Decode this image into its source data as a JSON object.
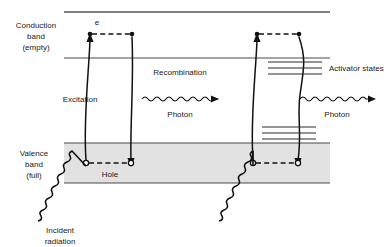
{
  "figure": {
    "background_color": "#ffffff",
    "line_color": "#111111",
    "band_fill_color": "#e2e2e2",
    "band_edge_color": "#4a4a4a"
  },
  "labels": {
    "conduction_band": "Conduction\nband\n(empty)",
    "conduction_band_line1": "Conduction",
    "conduction_band_line2": "band",
    "conduction_band_line3": "(empty)",
    "valence_band_line1": "Valence",
    "valence_band_line2": "band",
    "valence_band_line3": "(full)",
    "electron": "e",
    "hole": "Hole",
    "excitation": "Excitation",
    "recombination": "Recombination",
    "photon_left": "Photon",
    "photon_right": "Photon",
    "activator_states": "Activator states",
    "incident_radiation_line1": "Incident",
    "incident_radiation_line2": "radiation"
  },
  "bands": {
    "conduction": {
      "top_y": 12,
      "bottom_y": 58,
      "x_start": 64,
      "x_end": 330,
      "state": "empty"
    },
    "valence": {
      "top_y": 143,
      "bottom_y": 183,
      "x_start": 64,
      "x_end": 330,
      "state": "full",
      "filled": true
    }
  },
  "activator_states": {
    "upper_set": {
      "count": 3,
      "y_values": [
        62,
        68,
        74
      ],
      "x_start": 268,
      "x_end": 322
    },
    "lower_set": {
      "count": 3,
      "y_values": [
        127,
        133,
        139
      ],
      "x_start": 262,
      "x_end": 316
    }
  },
  "processes": [
    {
      "name": "excitation-left",
      "type": "electron-excitation",
      "direction": "up",
      "from": "valence band",
      "to": "conduction band"
    },
    {
      "name": "recombination-left",
      "type": "electron-recombination",
      "direction": "down",
      "from": "conduction band",
      "to": "valence band"
    },
    {
      "name": "excitation-right",
      "type": "electron-excitation",
      "direction": "up",
      "from": "valence band",
      "to": "conduction band"
    },
    {
      "name": "recombination-right",
      "type": "electron-recombination-via-activator",
      "direction": "down",
      "from": "conduction band",
      "to": "valence band"
    }
  ],
  "carriers": {
    "electrons": [
      {
        "x": 90,
        "y": 34,
        "type": "filled"
      },
      {
        "x": 132,
        "y": 34,
        "type": "filled"
      },
      {
        "x": 257,
        "y": 34,
        "type": "filled"
      },
      {
        "x": 299,
        "y": 34,
        "type": "filled"
      }
    ],
    "holes": [
      {
        "x": 86,
        "y": 163,
        "type": "open"
      },
      {
        "x": 131,
        "y": 163,
        "type": "open"
      },
      {
        "x": 253,
        "y": 163,
        "type": "open"
      },
      {
        "x": 298,
        "y": 163,
        "type": "open"
      }
    ]
  },
  "photons": [
    {
      "name": "photon-left",
      "x_start": 142,
      "x_end": 218,
      "y": 99,
      "direction": "right"
    },
    {
      "name": "photon-right",
      "x_start": 300,
      "x_end": 375,
      "y": 99,
      "direction": "right"
    }
  ],
  "incident_radiation": [
    {
      "name": "incident-left",
      "x_start": 35,
      "y_start": 222,
      "x_end": 86,
      "y_end": 163
    },
    {
      "name": "incident-right",
      "x_start": 218,
      "y_start": 222,
      "x_end": 253,
      "y_end": 163
    }
  ]
}
